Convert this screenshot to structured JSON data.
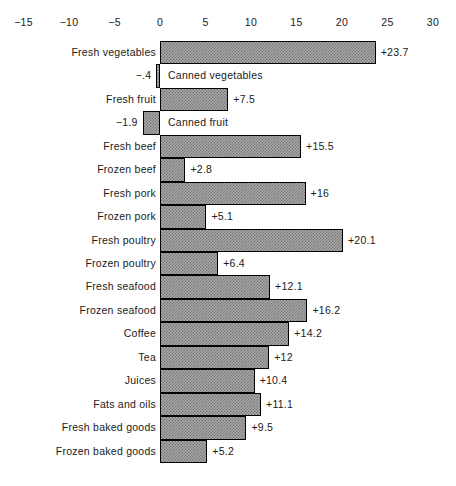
{
  "chart_data": {
    "type": "bar",
    "orientation": "horizontal",
    "title": "",
    "subtitle": "",
    "xlabel": "",
    "ylabel": "",
    "xlim": [
      -15,
      30
    ],
    "xticks": [
      -15,
      -10,
      -5,
      0,
      5,
      10,
      15,
      20,
      25,
      30
    ],
    "xtick_labels": [
      "−15",
      "−10",
      "−5",
      "0",
      "5",
      "10",
      "15",
      "20",
      "25",
      "30"
    ],
    "grid": false,
    "legend": null,
    "zero_line": 0,
    "categories": [
      "Fresh vegetables",
      "Canned vegetables",
      "Fresh fruit",
      "Canned fruit",
      "Fresh beef",
      "Frozen beef",
      "Fresh pork",
      "Frozen pork",
      "Fresh poultry",
      "Frozen poultry",
      "Fresh seafood",
      "Frozen seafood",
      "Coffee",
      "Tea",
      "Juices",
      "Fats and oils",
      "Fresh baked goods",
      "Frozen baked goods"
    ],
    "values": [
      23.7,
      -0.4,
      7.5,
      -1.9,
      15.5,
      2.8,
      16,
      5.1,
      20.1,
      6.4,
      12.1,
      16.2,
      14.2,
      12,
      10.4,
      11.1,
      9.5,
      5.2
    ],
    "data_labels": [
      "+23.7",
      "−.4",
      "+7.5",
      "−1.9",
      "+15.5",
      "+2.8",
      "+16",
      "+5.1",
      "+20.1",
      "+6.4",
      "+12.1",
      "+16.2",
      "+14.2",
      "+12",
      "+10.4",
      "+11.1",
      "+9.5",
      "+5.2"
    ],
    "bar_fill_color": "#a8a8a8",
    "bar_edge_color": "#000000",
    "background_color": "#ffffff",
    "text_color": "#1a1a1a"
  }
}
